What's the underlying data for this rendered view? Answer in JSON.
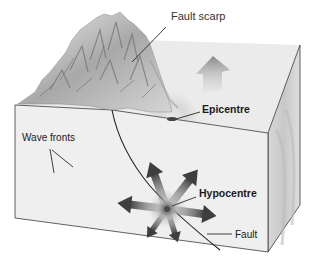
{
  "diagram": {
    "type": "earthquake-block-diagram",
    "labels": {
      "fault_scarp": "Fault scarp",
      "epicentre": "Epicentre",
      "wave_fronts": "Wave fronts",
      "hypocentre": "Hypocentre",
      "fault": "Fault"
    },
    "colors": {
      "background": "#ffffff",
      "block_front": "#d9d9d9",
      "block_top": "#e4e4e4",
      "block_side": "#cfcfcf",
      "wave_light": "#ececec",
      "wave_dark": "#c6c6c6",
      "arrow": "#4a4a4a",
      "outline": "#3a3a3a",
      "mountain_light": "#e6e6e6",
      "mountain_dark": "#7a7a7a"
    },
    "elements": {
      "block": "3D crust block cut-away",
      "terrain": "raised mountainous terrain behind fault scarp",
      "fault_line": "curved fault plane trace",
      "hypocentre_marker": "focus point with radiating arrows",
      "epicentre_marker": "surface point above hypocentre",
      "surface_arrow": "upward arrow on top surface",
      "radiating_arrows_count": 7
    }
  }
}
